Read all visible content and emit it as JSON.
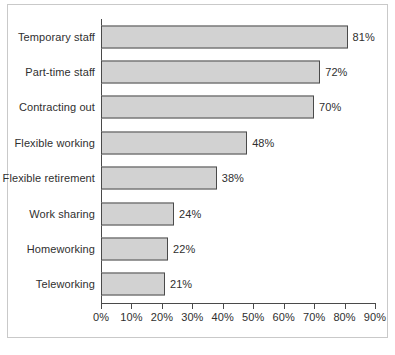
{
  "chart_data": {
    "type": "bar",
    "orientation": "horizontal",
    "title": "",
    "subtitle": "",
    "xlabel": "",
    "ylabel": "",
    "xlim": [
      0,
      90
    ],
    "grid": false,
    "legend": false,
    "categories": [
      "Temporary staff",
      "Part-time staff",
      "Contracting out",
      "Flexible working",
      "Flexible retirement",
      "Work sharing",
      "Homeworking",
      "Teleworking"
    ],
    "values": [
      81,
      72,
      70,
      48,
      38,
      24,
      22,
      21
    ],
    "value_labels": [
      "81%",
      "72%",
      "70%",
      "48%",
      "38%",
      "24%",
      "22%",
      "21%"
    ],
    "xticks": [
      0,
      10,
      20,
      30,
      40,
      50,
      60,
      70,
      80,
      90
    ],
    "xtick_labels": [
      "0%",
      "10%",
      "20%",
      "30%",
      "40%",
      "50%",
      "60%",
      "70%",
      "80%",
      "90%"
    ],
    "colors": {
      "bar_fill": "#d2d2d2",
      "bar_border": "#4a4a4a",
      "axis": "#4a4a4a",
      "text": "#2f2f2f",
      "frame": "#c9c9c9",
      "background": "#ffffff"
    }
  }
}
